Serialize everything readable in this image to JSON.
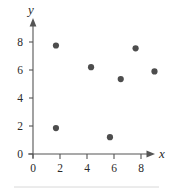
{
  "chart_data": {
    "type": "scatter",
    "title": "",
    "subtitle": "",
    "xlabel": "x",
    "ylabel": "y",
    "xlim": [
      0,
      10.2
    ],
    "ylim": [
      0,
      9.0
    ],
    "grid": false,
    "legend": false,
    "legend_position": "none",
    "x_ticks": [
      0,
      2,
      4,
      6,
      8
    ],
    "y_ticks": [
      0,
      2,
      4,
      6,
      8
    ],
    "x_tick_labels": [
      "0",
      "2",
      "4",
      "6",
      "8"
    ],
    "y_tick_labels": [
      "0",
      "2",
      "4",
      "6",
      "8"
    ],
    "axis_arrows": {
      "x": "right",
      "y": "up"
    },
    "point_color": "#4d4d4d",
    "points": [
      {
        "x": 1.7,
        "y": 7.75
      },
      {
        "x": 1.7,
        "y": 1.85
      },
      {
        "x": 4.3,
        "y": 6.2
      },
      {
        "x": 5.7,
        "y": 1.2
      },
      {
        "x": 6.5,
        "y": 5.35
      },
      {
        "x": 7.6,
        "y": 7.55
      },
      {
        "x": 9.0,
        "y": 5.9
      }
    ],
    "series": [
      {
        "name": "data",
        "x": [
          1.7,
          1.7,
          4.3,
          5.7,
          6.5,
          7.6,
          9.0
        ],
        "values": [
          7.75,
          1.85,
          6.2,
          1.2,
          5.35,
          7.55,
          5.9
        ]
      }
    ]
  }
}
